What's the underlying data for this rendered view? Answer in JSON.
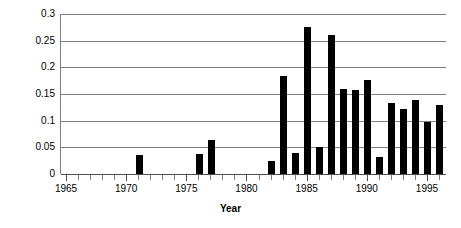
{
  "chart_data": {
    "type": "bar",
    "title": "",
    "xlabel": "Year",
    "ylabel": "Fraction",
    "xlim": [
      1964.5,
      1996.5
    ],
    "ylim": [
      0,
      0.3
    ],
    "grid": true,
    "legend": false,
    "legend_position": "none",
    "bar_color": "#000000",
    "gridline_color": "#808080",
    "y_ticks": [
      0,
      0.05,
      0.1,
      0.15,
      0.2,
      0.25,
      0.3
    ],
    "y_tick_labels": [
      "0",
      "0.05",
      "0.1",
      "0.15",
      "0.2",
      "0.25",
      "0.3"
    ],
    "x_ticks": [
      1965,
      1966,
      1967,
      1968,
      1969,
      1970,
      1971,
      1972,
      1973,
      1974,
      1975,
      1976,
      1977,
      1978,
      1979,
      1980,
      1981,
      1982,
      1983,
      1984,
      1985,
      1986,
      1987,
      1988,
      1989,
      1990,
      1991,
      1992,
      1993,
      1994,
      1995,
      1996
    ],
    "x_major_ticks": [
      1965,
      1970,
      1975,
      1980,
      1985,
      1990,
      1995
    ],
    "x_tick_labels": [
      "1965",
      "1970",
      "1975",
      "1980",
      "1985",
      "1990",
      "1995"
    ],
    "categories": [
      1965,
      1966,
      1967,
      1968,
      1969,
      1970,
      1971,
      1972,
      1973,
      1974,
      1975,
      1976,
      1977,
      1978,
      1979,
      1980,
      1981,
      1982,
      1983,
      1984,
      1985,
      1986,
      1987,
      1988,
      1989,
      1990,
      1991,
      1992,
      1993,
      1994,
      1995,
      1996
    ],
    "values": [
      0,
      0,
      0,
      0,
      0,
      0,
      0.036,
      0,
      0,
      0,
      0,
      0.038,
      0.064,
      0,
      0,
      0,
      0,
      0.025,
      0.183,
      0.039,
      0.275,
      0.05,
      0.26,
      0.16,
      0.158,
      0.176,
      0.032,
      0.134,
      0.121,
      0.139,
      0.097,
      0.129
    ]
  }
}
